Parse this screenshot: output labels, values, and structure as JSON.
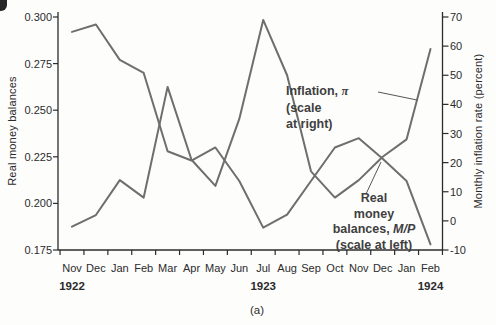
{
  "chart_data": {
    "type": "line",
    "panel_label": "(a)",
    "x_categories": [
      "Nov",
      "Dec",
      "Jan",
      "Feb",
      "Mar",
      "Apr",
      "May",
      "Jun",
      "Jul",
      "Aug",
      "Sep",
      "Oct",
      "Nov",
      "Dec",
      "Jan",
      "Feb"
    ],
    "year_labels": [
      {
        "text": "1922",
        "month_index": 0
      },
      {
        "text": "1923",
        "month_index": 8
      },
      {
        "text": "1924",
        "month_index": 15
      }
    ],
    "left_axis": {
      "label": "Real money balances",
      "ticks": [
        "0.300",
        "0.275",
        "0.250",
        "0.225",
        "0.200",
        "0.175"
      ],
      "range": [
        0.175,
        0.3
      ]
    },
    "right_axis": {
      "label": "Monthly inflation rate (percent)",
      "ticks": [
        "70",
        "60",
        "50",
        "40",
        "30",
        "20",
        "10",
        "0",
        "-10"
      ],
      "range": [
        -10,
        70
      ]
    },
    "grid": "off",
    "line_color": "#6e6e6e",
    "series": [
      {
        "name": "Real money balances, M/P",
        "axis": "left",
        "values": [
          0.292,
          0.296,
          0.277,
          0.27,
          0.228,
          0.223,
          0.23,
          0.212,
          0.187,
          0.194,
          0.212,
          0.23,
          0.235,
          0.224,
          0.212,
          0.178
        ]
      },
      {
        "name": "Inflation, π",
        "axis": "right",
        "values": [
          -2,
          2,
          14,
          8,
          46,
          21,
          12,
          35,
          69,
          50,
          17,
          8,
          14,
          22,
          28,
          59
        ]
      }
    ],
    "annotations": [
      {
        "id": "inflation-label",
        "lines": [
          "Inflation, π",
          "(scale",
          "at right)"
        ]
      },
      {
        "id": "mp-label",
        "lines": [
          "Real",
          "money",
          "balances, M/P",
          "(scale at left)"
        ]
      }
    ]
  }
}
